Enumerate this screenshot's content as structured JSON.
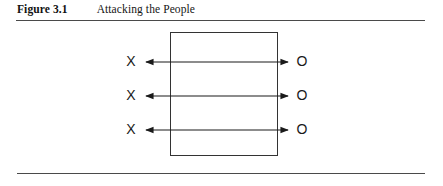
{
  "figure": {
    "label": "Figure 3.1",
    "title": "Attacking the People",
    "rule_color": "#4a4a4a"
  },
  "diagram": {
    "type": "research-design-notation",
    "box": {
      "x": 170,
      "y": 32,
      "width": 107,
      "height": 123,
      "stroke": "#333333"
    },
    "stroke_color": "#1a1a1a",
    "rows": [
      {
        "left_label": "X",
        "right_label": "O",
        "y": 62,
        "arrow_start_x": 146,
        "arrow_end_x": 288
      },
      {
        "left_label": "X",
        "right_label": "O",
        "y": 96,
        "arrow_start_x": 146,
        "arrow_end_x": 288
      },
      {
        "left_label": "X",
        "right_label": "O",
        "y": 130,
        "arrow_start_x": 146,
        "arrow_end_x": 288
      }
    ],
    "left_label_x": 130,
    "right_label_x": 301,
    "arrow_style": "double-headed"
  }
}
